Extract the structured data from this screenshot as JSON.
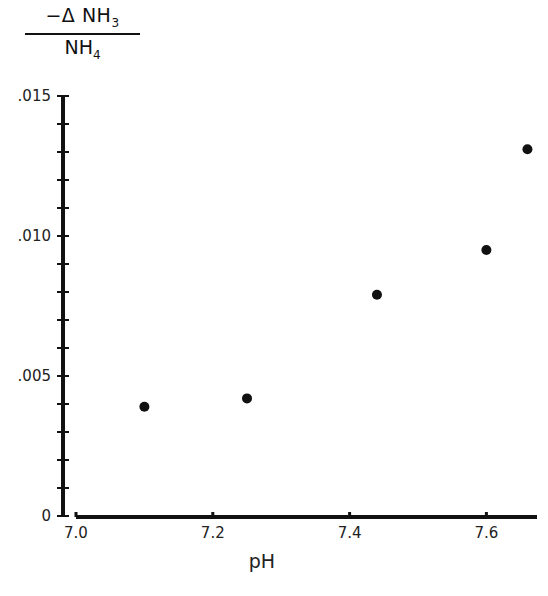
{
  "chart_data": {
    "type": "scatter",
    "title": "",
    "xlabel": "pH",
    "ylabel": "−Δ NH3 / NH4",
    "ylabel_parts": {
      "numerator": "−Δ NH",
      "numerator_sub": "3",
      "denominator": "NH",
      "denominator_sub": "4"
    },
    "xlim": [
      7.0,
      7.675
    ],
    "ylim": [
      0,
      0.015
    ],
    "x_ticks": [
      7.0,
      7.2,
      7.4,
      7.6
    ],
    "x_tick_labels": [
      "7.0",
      "7.2",
      "7.4",
      "7.6"
    ],
    "y_ticks": [
      0,
      0.005,
      0.01,
      0.015
    ],
    "y_tick_labels": [
      "0",
      ".005",
      ".010",
      ".015"
    ],
    "y_minor_step": 0.001,
    "grid": false,
    "legend": null,
    "series": [
      {
        "name": "data",
        "points": [
          {
            "x": 7.1,
            "y": 0.0039
          },
          {
            "x": 7.25,
            "y": 0.0042
          },
          {
            "x": 7.44,
            "y": 0.0079
          },
          {
            "x": 7.6,
            "y": 0.0095
          },
          {
            "x": 7.66,
            "y": 0.0131
          }
        ]
      }
    ]
  }
}
